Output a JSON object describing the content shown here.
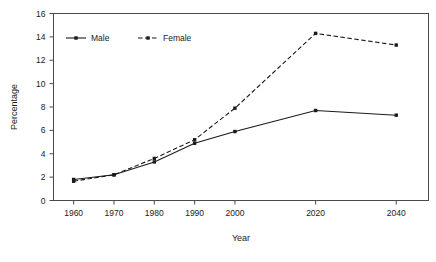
{
  "chart_data": {
    "type": "line",
    "title": "",
    "xlabel": "Year",
    "ylabel": "Percentage",
    "categories": [
      1960,
      1970,
      1980,
      1990,
      2000,
      2020,
      2040
    ],
    "tick_labels_x": [
      "1960",
      "1970",
      "1980",
      "1990",
      "2000",
      "2020",
      "2040"
    ],
    "tick_labels_y": [
      "0",
      "2",
      "4",
      "6",
      "8",
      "10",
      "12",
      "14",
      "16"
    ],
    "ylim": [
      0,
      16
    ],
    "ytick_step": 2,
    "xlim": [
      1955,
      2048
    ],
    "grid": false,
    "legend_position": "top-left-inside",
    "series": [
      {
        "name": "Male",
        "line_style": "solid",
        "marker": "square",
        "color": "#1a1a1a",
        "values": [
          1.8,
          2.2,
          3.3,
          4.9,
          5.9,
          7.7,
          7.3
        ]
      },
      {
        "name": "Female",
        "line_style": "dashed",
        "marker": "square",
        "color": "#1a1a1a",
        "values": [
          1.65,
          2.2,
          3.6,
          5.2,
          7.9,
          14.3,
          13.3
        ]
      }
    ]
  },
  "legend": {
    "entries": [
      {
        "label": "Male"
      },
      {
        "label": "Female"
      }
    ]
  },
  "axes": {
    "x_title": "Year",
    "y_title": "Percentage"
  }
}
